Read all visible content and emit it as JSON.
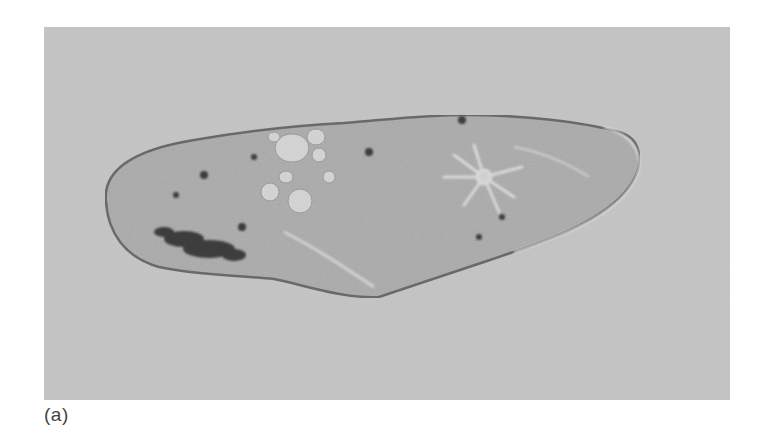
{
  "figure": {
    "panel_label": "(a)",
    "colors": {
      "background": "#c4c4c4",
      "cell_body": "#b2b2b2",
      "cell_edge": "#7a7a7a",
      "dark_inclusions": "#3a3a3a",
      "vacuoles": "#d4d4d4"
    }
  }
}
